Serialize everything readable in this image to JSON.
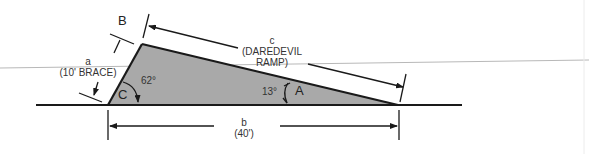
{
  "diagram": {
    "type": "right-triangle-ramp",
    "vertices": {
      "A": {
        "label": "A",
        "angle": "13°"
      },
      "B": {
        "label": "B"
      },
      "C": {
        "label": "C",
        "angle": "62°"
      }
    },
    "sides": {
      "a": {
        "letter": "a",
        "desc": "(10' BRACE)"
      },
      "b": {
        "letter": "b",
        "desc": "(40')"
      },
      "c": {
        "letter": "c",
        "desc_line1": "(DAREDEVIL",
        "desc_line2": "RAMP)"
      }
    },
    "colors": {
      "fill": "#a9a9a9",
      "stroke": "#1a1a1a",
      "guide": "#b0b0b0"
    }
  }
}
